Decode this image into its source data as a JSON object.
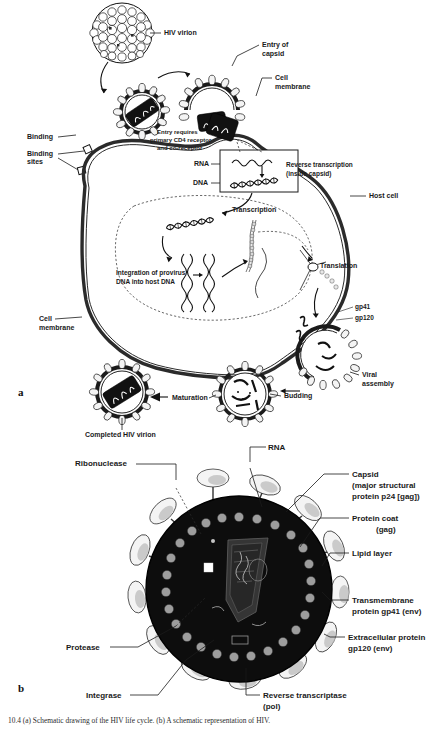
{
  "figure": {
    "panel_a_letter": "a",
    "panel_b_letter": "b",
    "caption": "10.4 (a) Schematic drawing of the HIV life cycle. (b) A schematic representation of HIV.",
    "colors": {
      "ink": "#1a1a1a",
      "paper": "#ffffff",
      "capsid_dark": "#0d0d0d",
      "spike_fill": "#f4f4f4",
      "bead_gray": "#9d9d9d"
    }
  },
  "panel_a": {
    "title_letter": "a",
    "labels": {
      "hiv_virion": "HIV virion",
      "entry_of_capsid": "Entry of\ncapsid",
      "entry_of_capsid_l1": "Entry of",
      "entry_of_capsid_l2": "capsid",
      "cell_membrane_top": "Cell",
      "cell_membrane_top2": "membrane",
      "binding": "Binding",
      "binding_sites_l1": "Binding",
      "binding_sites_l2": "sites",
      "entry_requires_l1": "Entry requires",
      "entry_requires_l2": "primary CD4 receptor",
      "entry_requires_l3": "and co-receptor",
      "rna": "RNA",
      "dna": "DNA",
      "reverse_transcription_l1": "Reverse transcription",
      "reverse_transcription_l2": "(inside capsid)",
      "host_cell": "Host cell",
      "transcription": "Transcription",
      "translation": "Translation",
      "integration_l1": "Integration of provirus",
      "integration_l2": "DNA into host DNA",
      "cell_membrane_left_l1": "Cell",
      "cell_membrane_left_l2": "membrane",
      "gp41": "gp41",
      "gp120": "gp120",
      "viral_assembly_l1": "Viral",
      "viral_assembly_l2": "assembly",
      "budding": "Budding",
      "maturation": "Maturation",
      "completed_hiv_virion": "Completed HIV virion"
    }
  },
  "panel_b": {
    "title_letter": "b",
    "labels": {
      "ribonuclease": "Ribonuclease",
      "rna": "RNA",
      "capsid_l1": "Capsid",
      "capsid_l2": "(major structural",
      "capsid_l3": "protein p24 [gag])",
      "protein_coat_l1": "Protein coat",
      "protein_coat_l2": "(gag)",
      "lipid_layer": "Lipid layer",
      "transmembrane_l1": "Transmembrane",
      "transmembrane_l2": "protein gp41 (env)",
      "extracellular_l1": "Extracellular protein",
      "extracellular_l2": "gp120 (env)",
      "protease": "Protease",
      "integrase": "Integrase",
      "reverse_transcriptase_l1": "Reverse transcriptase",
      "reverse_transcriptase_l2": "(pol)"
    }
  }
}
